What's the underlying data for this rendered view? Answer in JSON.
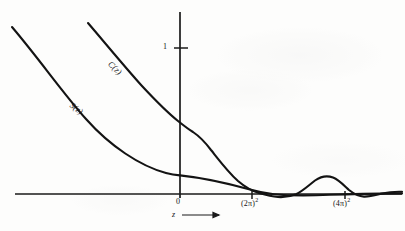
{
  "figure": {
    "background_color": "#fdfdfc",
    "ink_color": "#131313",
    "axes": {
      "x_axis": {
        "name": "z",
        "label": "z",
        "arrow": "→",
        "y_pixel": 194,
        "x_start_pixel": 15,
        "x_end_pixel": 402
      },
      "y_axis": {
        "x_pixel": 180,
        "y_top_pixel": 12,
        "y_bottom_pixel": 198,
        "ticks": [
          {
            "label": "1",
            "value": 1,
            "y_pixel": 48
          }
        ]
      },
      "x_ticks": [
        {
          "label": "0",
          "value": 0,
          "x_pixel": 180
        },
        {
          "label": "(2π)²",
          "base": "(2π)",
          "exponent": "2",
          "x_pixel": 252
        },
        {
          "label": "(4π)²",
          "base": "(4π)",
          "exponent": "2",
          "x_pixel": 345
        }
      ]
    },
    "curves": [
      {
        "name": "S(z)",
        "label": "S(z)",
        "description": "Stumpff function S(z), upper-left descending curve, flattens toward the z axis and dips slightly negative after (2pi)^2",
        "label_position": {
          "x": 74,
          "y": 100,
          "rotation_deg": 37
        },
        "path": "M 12,27 C 40,60 62,92 86,119 C 110,146 140,166 166,173 C 172,174.5 176,175 180,175.4 C 205,178 230,184 250,189.5 C 258,191.7 266,193.4 274,194.2 C 290,195.8 310,195.6 330,194.8 C 352,194 376,193.6 402,193.4"
      },
      {
        "name": "C(z)",
        "label": "C(z)",
        "description": "Stumpff function C(z), steeply descending curve crossing the vertical axis near 0.5, with a shoulder then falling to the z axis near (2pi)^2 and oscillating with a positive hump before (4pi)^2",
        "label_position": {
          "x": 113,
          "y": 59,
          "rotation_deg": 43
        },
        "path": "M 88,23 C 106,44 124,66 142,86 C 156,101 168,113 178,121 C 183,125 188,129 193,132 C 199,136 205,142 211,150 C 219,160 228,172 238,181 C 245,187 252,191 259,193 C 266,195 272,196.5 278,197 C 284,197.4 290,196.6 296,194.2 C 303,191 309,185 315,180.5 C 321,176.4 327,175.3 333,177.6 C 339,180 344,185.5 349,190 C 354,194 359,196.4 364,196.6 C 370,196.8 376,195 382,193.6 C 389,192 396,191.6 402,191.8"
      }
    ],
    "source_note": "scanned textbook figure"
  }
}
